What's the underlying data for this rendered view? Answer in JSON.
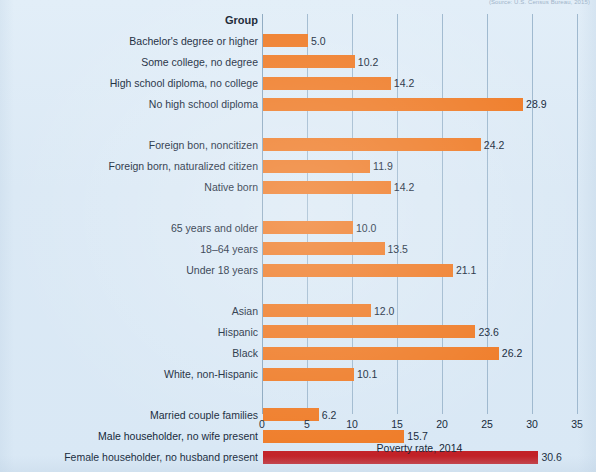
{
  "figure": {
    "top_caption": "(Source: U.S. Census Bureau, 2015)",
    "group_header": "Group",
    "axis_title": "Poverty rate, 2014",
    "colors": {
      "background": "#dceaf6",
      "bar": "#ef7c28",
      "bar_highlight": "#c22127",
      "gridline": "#9fb9cf",
      "text": "#16283a"
    }
  },
  "chart_data": {
    "type": "bar",
    "orientation": "horizontal",
    "title": "",
    "xlabel": "Poverty rate, 2014",
    "ylabel": "Group",
    "xlim": [
      0,
      35
    ],
    "xticks": [
      0,
      5,
      10,
      15,
      20,
      25,
      30,
      35
    ],
    "xtick_labels": [
      "0",
      "5",
      "10",
      "15",
      "20",
      "25",
      "30",
      "35"
    ],
    "grid": true,
    "legend": "none",
    "value_label_format": "one-decimal",
    "highlight_category": "Female householder, no husband present",
    "groups": [
      {
        "name": "educational attainment",
        "categories": [
          "Bachelor's degree or higher",
          "Some college, no degree",
          "High school diploma, no college",
          "No high school diploma"
        ],
        "values": [
          5.0,
          10.2,
          14.2,
          28.9
        ],
        "labels": [
          "5.0",
          "10.2",
          "14.2",
          "28.9"
        ]
      },
      {
        "name": "nativity",
        "categories": [
          "Foreign bon, noncitizen",
          "Foreign born, naturalized citizen",
          "Native born"
        ],
        "values": [
          24.2,
          11.9,
          14.2
        ],
        "labels": [
          "24.2",
          "11.9",
          "14.2"
        ]
      },
      {
        "name": "age",
        "categories": [
          "65 years and older",
          "18–64 years",
          "Under 18 years"
        ],
        "values": [
          10.0,
          13.5,
          21.1
        ],
        "labels": [
          "10.0",
          "13.5",
          "21.1"
        ]
      },
      {
        "name": "race and ethnicity",
        "categories": [
          "Asian",
          "Hispanic",
          "Black",
          "White, non-Hispanic"
        ],
        "values": [
          12.0,
          23.6,
          26.2,
          10.1
        ],
        "labels": [
          "12.0",
          "23.6",
          "26.2",
          "10.1"
        ]
      },
      {
        "name": "family type",
        "categories": [
          "Married couple families",
          "Male householder, no wife present",
          "Female householder, no husband present"
        ],
        "values": [
          6.2,
          15.7,
          30.6
        ],
        "labels": [
          "6.2",
          "15.7",
          "30.6"
        ]
      },
      {
        "name": "total",
        "categories": [
          "All persons"
        ],
        "values": [
          14.8
        ],
        "labels": [
          "14.8"
        ]
      }
    ]
  }
}
